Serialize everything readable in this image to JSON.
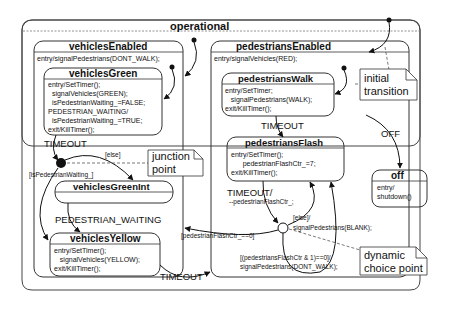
{
  "diagram": {
    "type": "UML state machine",
    "states": {
      "operational": {
        "name": "operational"
      },
      "vehiclesEnabled": {
        "name": "vehiclesEnabled",
        "actions": "entry/signalPedestrians(DONT_WALK);"
      },
      "vehiclesGreen": {
        "name": "vehiclesGreen",
        "actions": "entry/SetTimer();\n  signalVehicles(GREEN);\n  isPedestrianWaiting_=FALSE;\nPEDESTRIAN_WAITING/\n  isPedestrianWaiting_=TRUE;\nexit/KillTimer();"
      },
      "vehiclesGreenInt": {
        "name": "vehiclesGreenInt"
      },
      "vehiclesYellow": {
        "name": "vehiclesYellow",
        "actions": "entry/SetTimer();\n   signalVehicles(YELLOW);\nexit/KillTimer();"
      },
      "pedestriansEnabled": {
        "name": "pedestriansEnabled",
        "actions": "entry/signalVehicles(RED);"
      },
      "pedestriansWalk": {
        "name": "pedestriansWalk",
        "actions": "entry/SetTimer;\n   signalPedestrians(WALK);\nexit/KillTimer();"
      },
      "pedestriansFlash": {
        "name": "pedestriansFlash",
        "actions": "entry/SetTimer();\n      pedestrianFlashCtr_=7;\nexit/KillTimer();"
      },
      "off": {
        "name": "off",
        "actions": "entry/\nshutdown()"
      }
    },
    "transitions": {
      "timeout_green": "TIMEOUT",
      "else_junction": "[else]",
      "pedestrian_waiting_guard": "[isPedestrianWaiting_]",
      "pedestrian_waiting_event": "PEDESTRIAN_WAITING",
      "timeout_yellow": "TIMEOUT",
      "timeout_walk": "TIMEOUT",
      "timeout_flash": "TIMEOUT/",
      "timeout_flash_action": "--pedestrianFlashCtr_;",
      "else_choice": "[else]/",
      "else_choice_action": "signalPedestrians(BLANK);",
      "flash_zero_guard": "[pedestrianFlashCtr_==0]",
      "flash_odd_guard": "[(pedestriansFlashCtr & 1)==0]/",
      "flash_odd_action": "signalPedestrians(DONT_WALK);",
      "off_event": "OFF"
    },
    "notes": {
      "initial_transition": "initial\ntransition",
      "junction_point": "junction\npoint",
      "dynamic_choice_point": "dynamic\nchoice point"
    }
  }
}
